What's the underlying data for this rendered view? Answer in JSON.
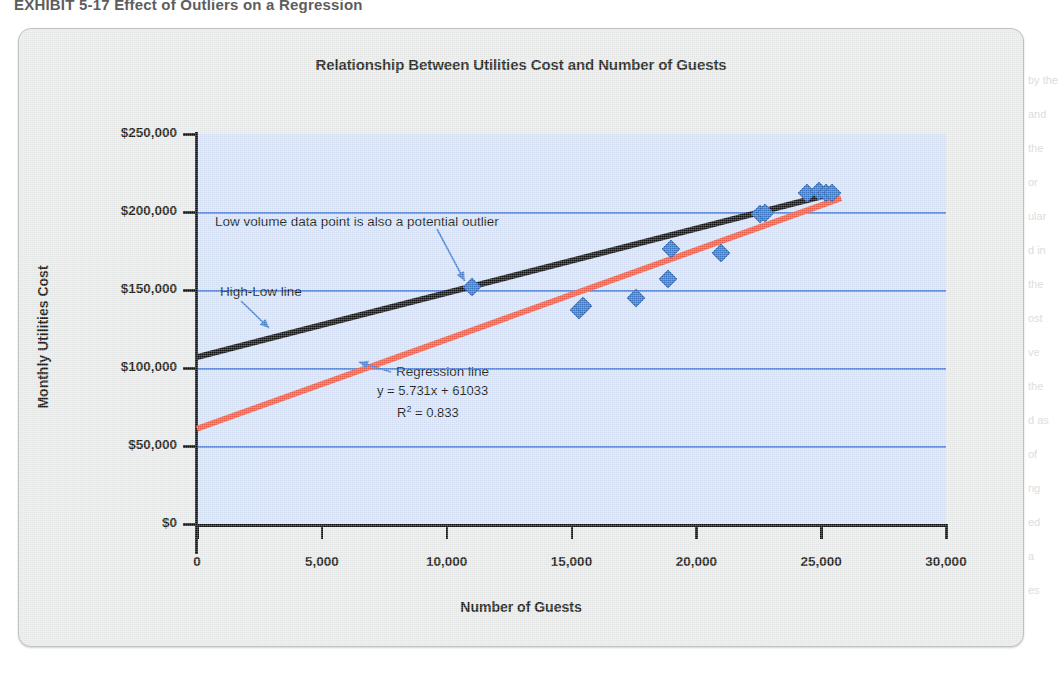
{
  "page": {
    "bleed_header": "EXHIBIT 5-17   Effect of Outliers on a Regression",
    "bleed_lines_right": [
      "by the",
      "and",
      "the",
      "or",
      "ular",
      "d in",
      "the",
      "ost",
      "ve",
      "the",
      "d as",
      "of",
      "ng",
      "ed",
      "a",
      "es"
    ]
  },
  "chart_data": {
    "type": "scatter",
    "title": "Relationship Between Utilities Cost and Number of Guests",
    "xlabel": "Number of Guests",
    "ylabel": "Monthly Utilities Cost",
    "xlim": [
      0,
      30000
    ],
    "ylim": [
      0,
      250000
    ],
    "xticks": [
      0,
      5000,
      10000,
      15000,
      20000,
      25000,
      30000
    ],
    "xtick_labels": [
      "0",
      "5,000",
      "10,000",
      "15,000",
      "20,000",
      "25,000",
      "30,000"
    ],
    "yticks": [
      0,
      50000,
      100000,
      150000,
      200000,
      250000
    ],
    "ytick_labels": [
      "$0",
      "$50,000",
      "$100,000",
      "$150,000",
      "$200,000",
      "$250,000"
    ],
    "grid": "horizontal",
    "grid_color": "#5b87d4",
    "plot_bg": "#d7e3f7",
    "legend": "none",
    "marker": "diamond",
    "marker_color": "#3f77c4",
    "points": [
      {
        "x": 11000,
        "y": 152000,
        "note": "low volume outlier"
      },
      {
        "x": 15300,
        "y": 137000
      },
      {
        "x": 15450,
        "y": 139500
      },
      {
        "x": 17600,
        "y": 145000
      },
      {
        "x": 18850,
        "y": 157000
      },
      {
        "x": 19000,
        "y": 176000
      },
      {
        "x": 21000,
        "y": 174000
      },
      {
        "x": 22550,
        "y": 199000
      },
      {
        "x": 22750,
        "y": 199500
      },
      {
        "x": 24450,
        "y": 212000
      },
      {
        "x": 24900,
        "y": 213500
      },
      {
        "x": 25200,
        "y": 212500
      },
      {
        "x": 25450,
        "y": 212000
      }
    ],
    "series": [
      {
        "name": "High-Low line",
        "type": "line",
        "color": "#111111",
        "width": 6,
        "x": [
          0,
          25500
        ],
        "y": [
          107000,
          212000
        ]
      },
      {
        "name": "Regression line",
        "type": "line",
        "color": "#e8604c",
        "width": 6,
        "equation": "y = 5.731x + 61033",
        "r_squared": 0.833,
        "x": [
          0,
          25800
        ],
        "y": [
          61033,
          208900
        ]
      }
    ],
    "annotations": [
      {
        "name": "outlier-note",
        "text": "Low volume data point is also a potential outlier",
        "target_x": 11000,
        "target_y": 152000
      },
      {
        "name": "high-low-note",
        "text": "High-Low line"
      },
      {
        "name": "regression-note",
        "text": "Regression line"
      },
      {
        "name": "regression-equation",
        "text": "y = 5.731x + 61033"
      },
      {
        "name": "regression-r2",
        "text": "R",
        "sup": "2",
        "text_after": " = 0.833"
      }
    ]
  }
}
